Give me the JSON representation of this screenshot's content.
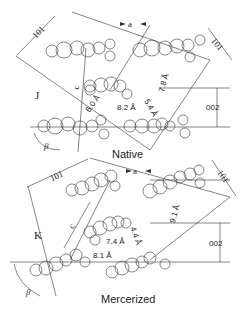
{
  "panels": [
    {
      "caption": "Native",
      "label_letter": "J",
      "axis_a": "a",
      "axis_c": "c",
      "plane_101": "101",
      "plane_101_right": "101",
      "plane_002": "002",
      "angle": "β",
      "distances": [
        "6.0 Å",
        "8.2 Å",
        "5.4 Å",
        "7.8 Å"
      ]
    },
    {
      "caption": "Mercerized",
      "label_letter": "K",
      "axis_a": "a",
      "axis_c": "c",
      "plane_101": "101",
      "plane_101_right": "101",
      "plane_002": "002",
      "angle": "β",
      "distances": [
        "7.4 Å",
        "8.1 Å",
        "4.4 Å",
        "9.1 Å"
      ]
    }
  ]
}
